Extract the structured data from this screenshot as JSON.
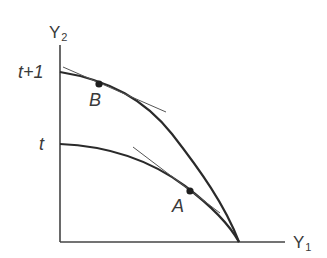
{
  "diagram": {
    "type": "production-possibility-frontier",
    "axes": {
      "y": {
        "label": "Y",
        "subscript": "2"
      },
      "x": {
        "label": "Y",
        "subscript": "1"
      }
    },
    "y_ticks": [
      {
        "label": "t+1",
        "position": "outer-curve-intercept"
      },
      {
        "label": "t",
        "position": "inner-curve-intercept"
      }
    ],
    "curves": [
      {
        "name": "period t+1 frontier",
        "intercept_label": "t+1",
        "tangent_point": "B"
      },
      {
        "name": "period t frontier",
        "intercept_label": "t",
        "tangent_point": "A"
      }
    ],
    "points": [
      {
        "label": "B",
        "curve": "t+1"
      },
      {
        "label": "A",
        "curve": "t"
      }
    ],
    "colors": {
      "line": "#2a2a2a",
      "tangent": "#555555",
      "text": "#3a3a3a",
      "background": "#ffffff"
    }
  }
}
